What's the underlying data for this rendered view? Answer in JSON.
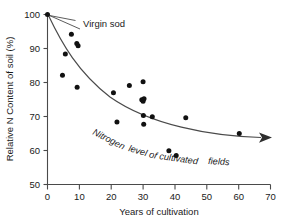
{
  "chart_data": {
    "type": "scatter",
    "title": "",
    "xlabel": "Years of cultivation",
    "ylabel": "Relative N Content of soil (%)",
    "xlim": [
      0,
      70
    ],
    "ylim": [
      50,
      100
    ],
    "xticks": [
      0,
      10,
      20,
      30,
      40,
      50,
      60,
      70
    ],
    "yticks": [
      50,
      60,
      70,
      80,
      90,
      100
    ],
    "grid": false,
    "legend": null,
    "annotations": [
      {
        "name": "virgin-sod",
        "text": "Virgin sod",
        "points_to_x": 0,
        "points_to_y": 100
      },
      {
        "name": "trend-curve-label",
        "text": "Nitrogen level of cultivated fields"
      }
    ],
    "series": [
      {
        "name": "Relative N content of cultivated soils",
        "marker": "filled-circle",
        "color": "#111111",
        "points": [
          {
            "x": 0,
            "y": 100.0
          },
          {
            "x": 4.7,
            "y": 82.1
          },
          {
            "x": 5.6,
            "y": 88.4
          },
          {
            "x": 7.5,
            "y": 94.2
          },
          {
            "x": 9.2,
            "y": 91.5
          },
          {
            "x": 9.6,
            "y": 90.8
          },
          {
            "x": 9.3,
            "y": 78.6
          },
          {
            "x": 20.7,
            "y": 77.0
          },
          {
            "x": 21.8,
            "y": 68.4
          },
          {
            "x": 25.7,
            "y": 79.1
          },
          {
            "x": 29.6,
            "y": 74.9
          },
          {
            "x": 30.0,
            "y": 74.5
          },
          {
            "x": 30.3,
            "y": 75.2
          },
          {
            "x": 30.0,
            "y": 80.2
          },
          {
            "x": 30.1,
            "y": 70.3
          },
          {
            "x": 30.2,
            "y": 67.7
          },
          {
            "x": 32.9,
            "y": 69.9
          },
          {
            "x": 38.1,
            "y": 59.9
          },
          {
            "x": 40.4,
            "y": 58.5
          },
          {
            "x": 43.4,
            "y": 69.6
          },
          {
            "x": 60.2,
            "y": 65.0
          }
        ]
      }
    ],
    "trend": {
      "name": "nitrogen-decline-curve",
      "description": "Exponential-decay curve from (0,100) to arrowhead at (70,59.5)",
      "start": {
        "x": 0,
        "y": 100
      },
      "end": {
        "x": 70,
        "y": 59.5
      },
      "arrow": true
    }
  },
  "axis": {
    "y_title": "Relative N Content of soil (%)",
    "x_title": "Years of cultivation",
    "y_tick_labels": [
      "100",
      "90",
      "80",
      "70",
      "60",
      "50"
    ],
    "x_tick_labels": [
      "0",
      "10",
      "20",
      "30",
      "40",
      "50",
      "60",
      "70"
    ]
  },
  "labels": {
    "virgin_sod": "Virgin sod",
    "curve_part1": "Nitrogen",
    "curve_part2": "level of",
    "curve_part3": "cultivated",
    "curve_part4": "fields"
  },
  "colors": {
    "marker": "#111111",
    "axis": "#4a4a4a",
    "background": "#ffffff"
  }
}
